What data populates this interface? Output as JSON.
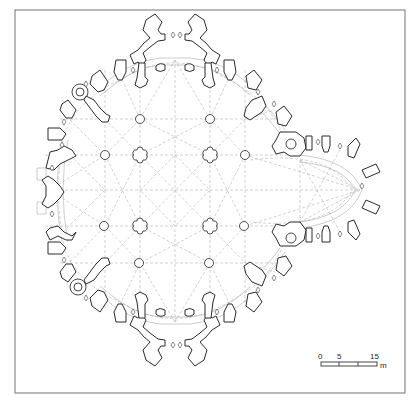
{
  "figure": {
    "type": "architectural floor plan",
    "colors": {
      "line": "#2a2a2a",
      "vault_lines": "#b4b4b4",
      "frame": "#8a8a8a",
      "background": "#ffffff"
    }
  },
  "piers": {
    "cross_shaped": [
      [
        140,
        155
      ],
      [
        210,
        155
      ],
      [
        140,
        226
      ],
      [
        210,
        226
      ]
    ],
    "round": [
      [
        140,
        119
      ],
      [
        210,
        119
      ],
      [
        105,
        155
      ],
      [
        245,
        155
      ],
      [
        104,
        226
      ],
      [
        244,
        226
      ],
      [
        139,
        263
      ],
      [
        209,
        263
      ]
    ]
  },
  "stair_turrets": [
    [
      78,
      92
    ],
    [
      78,
      287
    ],
    [
      291,
      139
    ],
    [
      291,
      240
    ]
  ],
  "scale_bar": {
    "labels": [
      "0",
      "5",
      "15"
    ],
    "unit": "m",
    "ticks_px": [
      321,
      339,
      358,
      377
    ]
  }
}
